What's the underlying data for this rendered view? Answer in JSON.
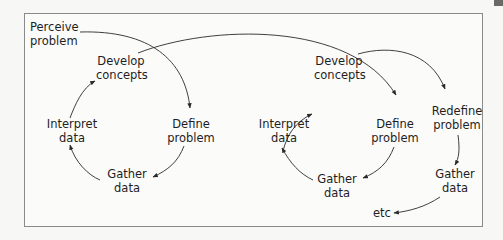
{
  "diagram": {
    "start": {
      "line1": "Perceive",
      "line2": "problem"
    },
    "cycle1": {
      "develop": {
        "line1": "Develop",
        "line2": "concepts"
      },
      "define": {
        "line1": "Define",
        "line2": "problem"
      },
      "gather": {
        "line1": "Gather",
        "line2": "data"
      },
      "interpret": {
        "line1": "Interpret",
        "line2": "data"
      }
    },
    "cycle2": {
      "develop": {
        "line1": "Develop",
        "line2": "concepts"
      },
      "define": {
        "line1": "Define",
        "line2": "problem"
      },
      "gather": {
        "line1": "Gather",
        "line2": "data"
      },
      "interpret": {
        "line1": "Interpret",
        "line2": "data"
      }
    },
    "cycle3": {
      "redefine": {
        "line1": "Redefine",
        "line2": "problem"
      },
      "gather": {
        "line1": "Gather",
        "line2": "data"
      },
      "continuation": "etc"
    },
    "colors": {
      "line": "#2a2a2a",
      "frame": "#8a8a8a",
      "background": "#fbfbfa"
    }
  }
}
